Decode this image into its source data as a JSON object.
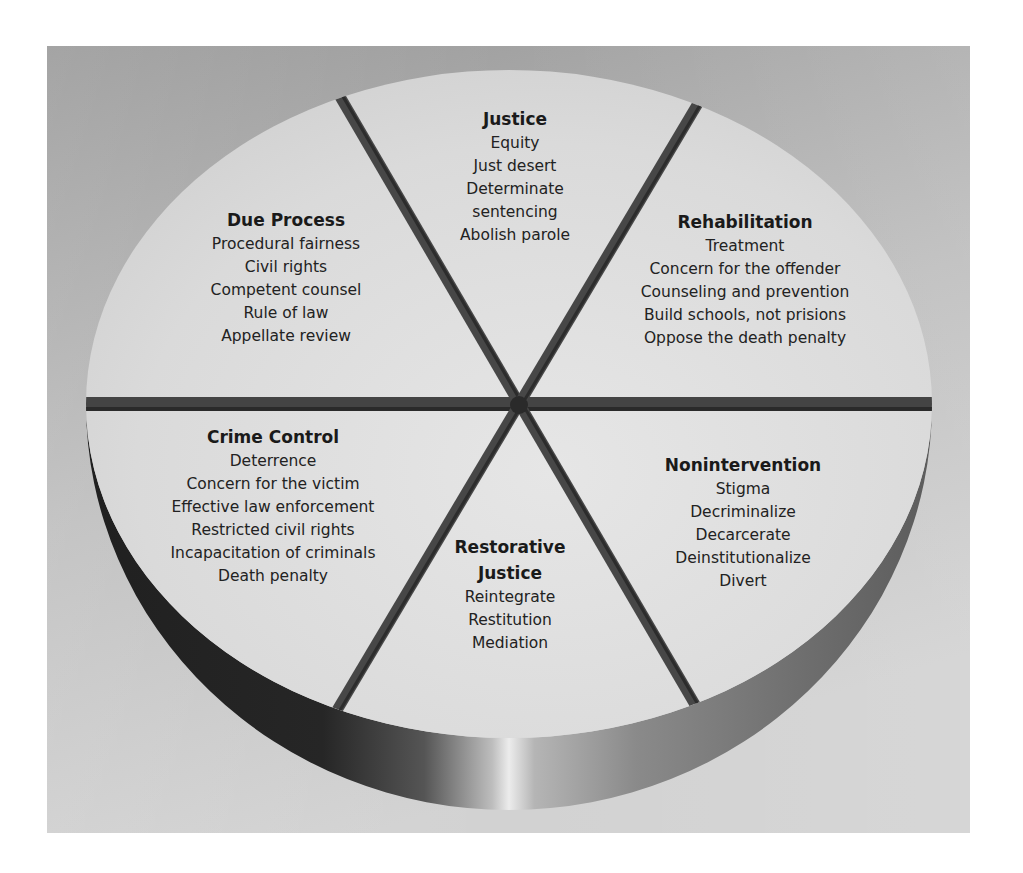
{
  "diagram": {
    "type": "perspective-wheel",
    "colors": {
      "frame_background_top": "#9c9c9c",
      "frame_background_bottom": "#cfcfcf",
      "wheel_face": "#dcdcdc",
      "spoke": "#4a4a4a",
      "rim_dark": "#2a2a2a",
      "rim_highlight": "#e8e8e8",
      "rim_right": "#707070",
      "text": "#1e1e1e"
    },
    "segments": [
      {
        "id": "due-process",
        "title": "Due Process",
        "items": [
          "Procedural fairness",
          "Civil rights",
          "Competent counsel",
          "Rule of law",
          "Appellate review"
        ]
      },
      {
        "id": "justice",
        "title": "Justice",
        "items": [
          "Equity",
          "Just desert",
          "Determinate",
          "sentencing",
          "Abolish parole"
        ]
      },
      {
        "id": "rehabilitation",
        "title": "Rehabilitation",
        "items": [
          "Treatment",
          "Concern for the offender",
          "Counseling and prevention",
          "Build schools, not prisions",
          "Oppose the death penalty"
        ]
      },
      {
        "id": "crime-control",
        "title": "Crime Control",
        "items": [
          "Deterrence",
          "Concern for the victim",
          "Effective law enforcement",
          "Restricted civil rights",
          "Incapacitation of criminals",
          "Death penalty"
        ]
      },
      {
        "id": "restorative-justice",
        "title_lines": [
          "Restorative",
          "Justice"
        ],
        "items": [
          "Reintegrate",
          "Restitution",
          "Mediation"
        ]
      },
      {
        "id": "nonintervention",
        "title": "Nonintervention",
        "items": [
          "Stigma",
          "Decriminalize",
          "Decarcerate",
          "Deinstitutionalize",
          "Divert"
        ]
      }
    ]
  }
}
